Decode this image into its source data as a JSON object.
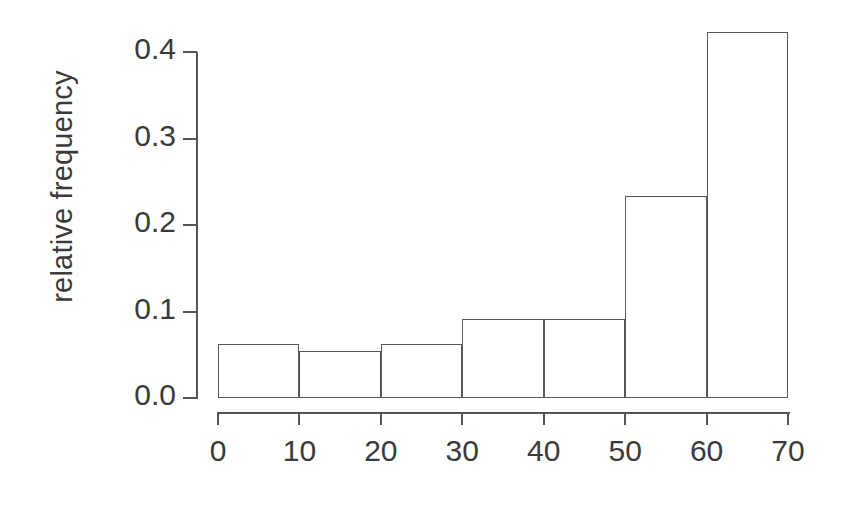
{
  "chart_data": {
    "type": "bar",
    "title": "",
    "subtitle": "",
    "xlabel": "",
    "ylabel": "relative frequency",
    "categories": [
      "0-10",
      "10-20",
      "20-30",
      "30-40",
      "40-50",
      "50-60",
      "60-70"
    ],
    "bin_edges": [
      0,
      10,
      20,
      30,
      40,
      50,
      60,
      70
    ],
    "values": [
      0.062,
      0.054,
      0.062,
      0.091,
      0.091,
      0.233,
      0.423
    ],
    "x": [
      0,
      10,
      20,
      30,
      40,
      50,
      60,
      70
    ],
    "xlim": [
      0,
      70
    ],
    "ylim": [
      0.0,
      0.4
    ],
    "xticks": [
      0,
      10,
      20,
      30,
      40,
      50,
      60,
      70
    ],
    "yticks": [
      0.0,
      0.1,
      0.2,
      0.3,
      0.4
    ],
    "xtick_labels": [
      "0",
      "10",
      "20",
      "30",
      "40",
      "50",
      "60",
      "70"
    ],
    "ytick_labels": [
      "0.0",
      "0.1",
      "0.2",
      "0.3",
      "0.4"
    ],
    "grid": false,
    "legend": null,
    "legend_position": "none",
    "bar_fill": "#ffffff",
    "bar_edge_color": "#585858",
    "axis_color": "#555555",
    "text_color": "#3a3a3a",
    "background": "#ffffff",
    "annotations": []
  }
}
